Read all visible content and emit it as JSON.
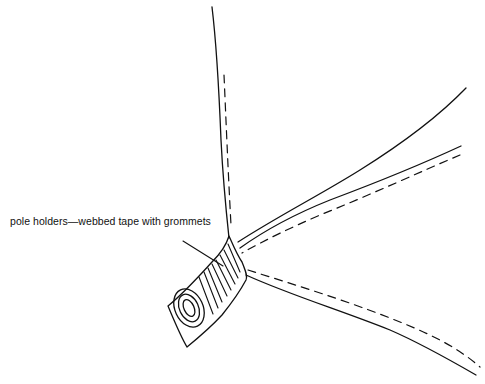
{
  "diagram": {
    "callout_label": "pole holders—webbed tape with grommets",
    "ink_color": "#111111",
    "background_color": "#ffffff",
    "elements": [
      "tent-panel-seam-vertical",
      "tent-panel-seam-upper-right",
      "tent-panel-seam-middle-right",
      "tent-panel-seam-lower-right",
      "webbed-tape-pole-holder",
      "grommet",
      "leader-line"
    ]
  }
}
